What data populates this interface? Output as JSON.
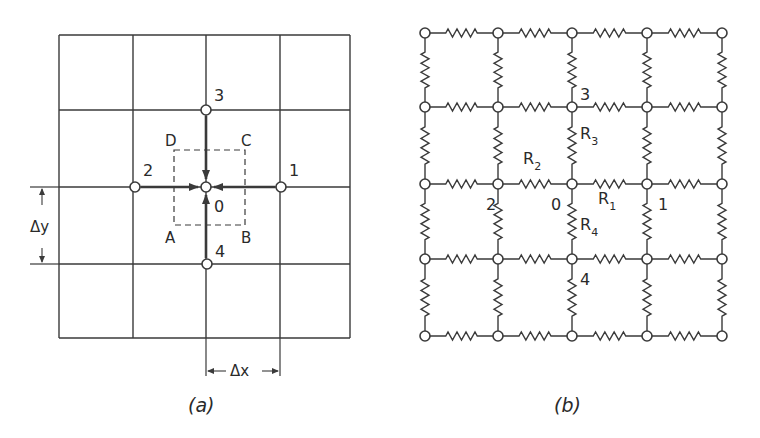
{
  "figure_a": {
    "caption": "(a)",
    "grid": {
      "x_lines": [
        59,
        133,
        206,
        280,
        350
      ],
      "y_lines": [
        35,
        110,
        187,
        264,
        338
      ]
    },
    "nodes": [
      {
        "id": "O",
        "label": "0",
        "x": 206,
        "y": 187,
        "lx": 214,
        "ly": 212
      },
      {
        "id": "1",
        "label": "1",
        "x": 281,
        "y": 187,
        "lx": 289,
        "ly": 176
      },
      {
        "id": "2",
        "label": "2",
        "x": 135,
        "y": 187,
        "lx": 143,
        "ly": 176
      },
      {
        "id": "3",
        "label": "3",
        "x": 206,
        "y": 110,
        "lx": 214,
        "ly": 101
      },
      {
        "id": "4",
        "label": "4",
        "x": 207,
        "y": 264,
        "lx": 215,
        "ly": 257
      }
    ],
    "control_volume": {
      "x": 174,
      "y": 150,
      "w": 71,
      "h": 75,
      "corners": [
        {
          "label": "D",
          "x": 165,
          "y": 146
        },
        {
          "label": "C",
          "x": 241,
          "y": 146
        },
        {
          "label": "A",
          "x": 165,
          "y": 243
        },
        {
          "label": "B",
          "x": 241,
          "y": 243
        }
      ]
    },
    "delta_x": {
      "label": "Δx"
    },
    "delta_y": {
      "label": "Δy"
    }
  },
  "figure_b": {
    "caption": "(b)",
    "node_x": [
      425,
      498,
      572,
      647,
      722
    ],
    "node_y": [
      33,
      107,
      184,
      259,
      336
    ],
    "labels": [
      {
        "text": "3",
        "x": 580,
        "y": 100
      },
      {
        "text": "2",
        "x": 486,
        "y": 210
      },
      {
        "text": "0",
        "x": 551,
        "y": 210
      },
      {
        "text": "1",
        "x": 658,
        "y": 210
      },
      {
        "text": "4",
        "x": 580,
        "y": 285
      }
    ],
    "resistors": [
      {
        "name": "R",
        "sub": "1",
        "x": 598,
        "y": 204
      },
      {
        "name": "R",
        "sub": "2",
        "x": 523,
        "y": 164
      },
      {
        "name": "R",
        "sub": "3",
        "x": 580,
        "y": 139
      },
      {
        "name": "R",
        "sub": "4",
        "x": 580,
        "y": 230
      }
    ]
  }
}
